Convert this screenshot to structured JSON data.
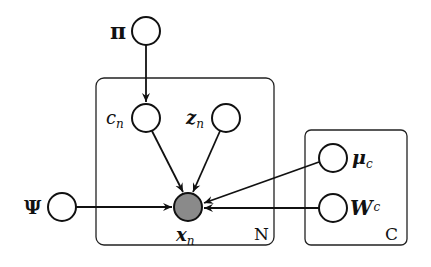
{
  "diagram": {
    "type": "graphical-model",
    "plates": [
      {
        "id": "N",
        "label": "N"
      },
      {
        "id": "C",
        "label": "C"
      }
    ],
    "nodes": {
      "pi": {
        "symbol": "π",
        "observed": false
      },
      "c": {
        "symbol": "c",
        "sub": "n",
        "observed": false
      },
      "z": {
        "symbol": "z",
        "sub": "n",
        "observed": false
      },
      "x": {
        "symbol": "x",
        "sub": "n",
        "observed": true
      },
      "psi": {
        "symbol": "Ψ",
        "observed": false
      },
      "mu": {
        "symbol": "μ",
        "sub": "c",
        "observed": false
      },
      "w": {
        "symbol": "W",
        "sub": "c",
        "observed": false
      }
    },
    "edges": [
      {
        "from": "π",
        "to": "c_n"
      },
      {
        "from": "c_n",
        "to": "x_n"
      },
      {
        "from": "z_n",
        "to": "x_n"
      },
      {
        "from": "Ψ",
        "to": "x_n"
      },
      {
        "from": "μ_c",
        "to": "x_n"
      },
      {
        "from": "W_c",
        "to": "x_n"
      }
    ],
    "colors": {
      "observed_fill": "#8a8a8a",
      "stroke": "#111111"
    }
  }
}
